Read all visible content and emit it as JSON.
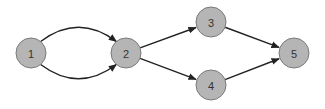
{
  "diagram": {
    "type": "directed-graph",
    "colors": {
      "node_fill": "#b5b5b5",
      "node_stroke": "#7a7a7a",
      "label": "#333333",
      "edge": "#222222",
      "background": "#ffffff"
    },
    "node_radius": 15,
    "nodes": [
      {
        "id": "1",
        "label": "1",
        "x": 31,
        "y": 53
      },
      {
        "id": "2",
        "label": "2",
        "x": 126,
        "y": 53
      },
      {
        "id": "3",
        "label": "3",
        "x": 211,
        "y": 22
      },
      {
        "id": "4",
        "label": "4",
        "x": 211,
        "y": 85
      },
      {
        "id": "5",
        "label": "5",
        "x": 294,
        "y": 53
      }
    ],
    "edges": [
      {
        "from": "1",
        "to": "2",
        "curve": "up"
      },
      {
        "from": "1",
        "to": "2",
        "curve": "down"
      },
      {
        "from": "2",
        "to": "3",
        "curve": "none"
      },
      {
        "from": "2",
        "to": "4",
        "curve": "none"
      },
      {
        "from": "3",
        "to": "5",
        "curve": "none"
      },
      {
        "from": "4",
        "to": "5",
        "curve": "none"
      }
    ]
  }
}
